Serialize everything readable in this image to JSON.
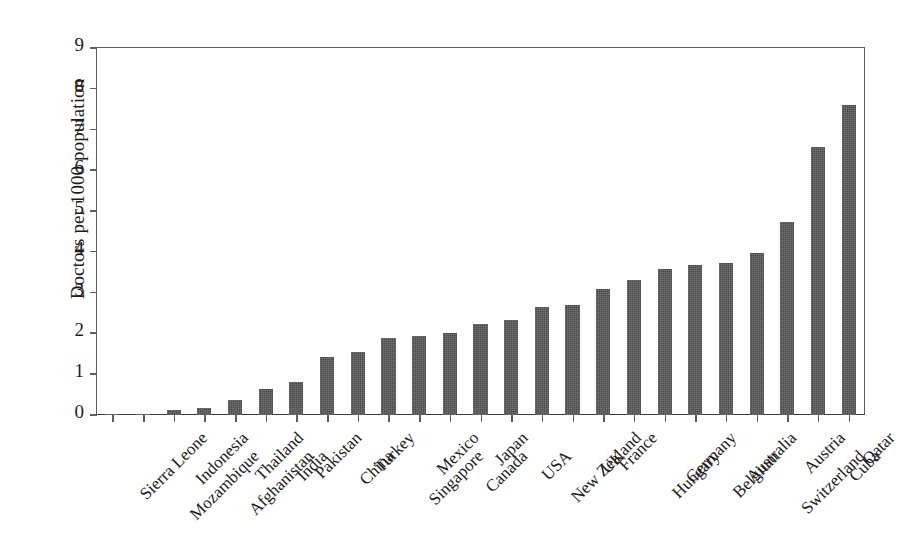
{
  "chart_data": {
    "type": "bar",
    "title": "",
    "subtitle": "",
    "xlabel": "",
    "ylabel": "Doctors per 1000 population",
    "ylim": [
      0,
      9
    ],
    "yticks": [
      0,
      1,
      2,
      3,
      4,
      5,
      6,
      7,
      8,
      9
    ],
    "ytick_labels": [
      "0",
      "1",
      "2",
      "3",
      "4",
      "5",
      "6",
      "7",
      "8",
      "9"
    ],
    "grid": false,
    "legend": null,
    "legend_position": "none",
    "bar_color": "#4d4d4d",
    "axis_color": "#5d5d5d",
    "background_color": "#ffffff",
    "categories": [
      "Sierra Leone",
      "Mozambique",
      "Indonesia",
      "Afghanistan",
      "Thailand",
      "India",
      "Pakistan",
      "China",
      "Turkey",
      "Singapore",
      "Mexico",
      "Canada",
      "Japan",
      "USA",
      "New Zealand",
      "UK",
      "France",
      "Hungary",
      "Germany",
      "Belgium",
      "Australia",
      "Switzerland",
      "Austria",
      "Cuba",
      "Qatar"
    ],
    "values": [
      0.02,
      0.03,
      0.13,
      0.17,
      0.37,
      0.65,
      0.8,
      1.42,
      1.54,
      1.88,
      1.93,
      2.0,
      2.23,
      2.33,
      2.65,
      2.7,
      3.08,
      3.32,
      3.58,
      3.68,
      3.72,
      3.97,
      4.74,
      6.58,
      7.6
    ]
  }
}
